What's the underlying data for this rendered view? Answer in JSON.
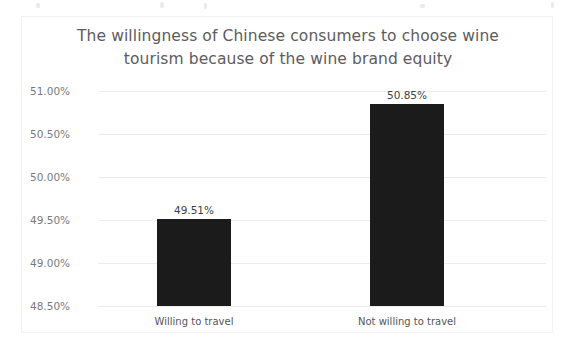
{
  "chart_data": {
    "type": "bar",
    "title": "The willingness of Chinese consumers to choose wine\ntourism because of the wine brand equity",
    "title_line_1": "The willingness of Chinese consumers to choose wine",
    "title_line_2": "tourism because of the wine brand equity",
    "xlabel": "",
    "ylabel": "",
    "categories": [
      "Willing to travel",
      "Not willing to travel"
    ],
    "values": [
      49.51,
      50.85
    ],
    "value_labels": [
      "49.51%",
      "50.85%"
    ],
    "ylim": [
      48.5,
      51.0
    ],
    "ytick_values": [
      51.0,
      50.5,
      50.0,
      49.5,
      49.0,
      48.5
    ],
    "ytick_labels": [
      "51.00%",
      "50.50%",
      "50.00%",
      "49.50%",
      "49.00%",
      "48.50%"
    ],
    "grid": true,
    "legend": false,
    "legend_position": "none",
    "bar_color": "#1b1b1b",
    "gridline_color": "#ececed",
    "title_color": "#5c5c60",
    "tick_label_color": "#7a7a7e",
    "background_color": "#ffffff",
    "border_color": "#f2f2f4"
  }
}
